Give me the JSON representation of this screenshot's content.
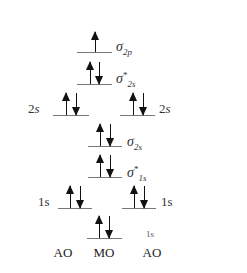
{
  "diagram": {
    "title": "",
    "levels": [
      {
        "id": "sigma_2p",
        "column": "MO",
        "y": 52,
        "x1": 77,
        "x2": 112,
        "electrons": "up",
        "label_symbol": "σ",
        "label_star": "",
        "label_sub": "2p"
      },
      {
        "id": "sigma_star_2s",
        "column": "MO",
        "y": 84,
        "x1": 77,
        "x2": 112,
        "electrons": "up-down",
        "label_symbol": "σ",
        "label_star": "*",
        "label_sub": "2s"
      },
      {
        "id": "ao_left_2s",
        "column": "AO",
        "y": 115,
        "x1": 53,
        "x2": 89,
        "electrons": "up-down",
        "label": "2s"
      },
      {
        "id": "ao_right_2s",
        "column": "AO",
        "y": 115,
        "x1": 120,
        "x2": 155,
        "electrons": "up-down",
        "label": "2s"
      },
      {
        "id": "sigma_2s",
        "column": "MO",
        "y": 146,
        "x1": 88,
        "x2": 122,
        "electrons": "up-down",
        "label_symbol": "σ",
        "label_star": "",
        "label_sub": "2s"
      },
      {
        "id": "sigma_star_1s",
        "column": "MO",
        "y": 177,
        "x1": 88,
        "x2": 122,
        "electrons": "up-down",
        "label_symbol": "σ",
        "label_star": "*",
        "label_sub": "1s"
      },
      {
        "id": "ao_left_1s",
        "column": "AO",
        "y": 208,
        "x1": 58,
        "x2": 92,
        "electrons": "up-down",
        "label": "1s"
      },
      {
        "id": "ao_right_1s",
        "column": "AO",
        "y": 208,
        "x1": 122,
        "x2": 156,
        "electrons": "up-down",
        "label": "1s"
      },
      {
        "id": "sigma_1s",
        "column": "MO",
        "y": 238,
        "x1": 87,
        "x2": 122,
        "electrons": "up-down",
        "label_fragment": "1s"
      }
    ],
    "labels": {
      "sigma_2p": {
        "symbol": "σ",
        "star": "",
        "sub": "2p"
      },
      "sigma_star_2s": {
        "symbol": "σ",
        "star": "*",
        "sub": "2s"
      },
      "sigma_2s": {
        "symbol": "σ",
        "star": "",
        "sub": "2s"
      },
      "sigma_star_1s": {
        "symbol": "σ",
        "star": "*",
        "sub": "1s"
      },
      "sigma_1s_fragment": "1s",
      "ao_left_2s": {
        "num": "2",
        "orb": "s"
      },
      "ao_right_2s": {
        "num": "2",
        "orb": "s"
      },
      "ao_left_1s": {
        "num": "1",
        "orb": "s"
      },
      "ao_right_1s": {
        "num": "1",
        "orb": "s"
      }
    },
    "columns": {
      "left": "AO",
      "middle": "MO",
      "right": "AO"
    },
    "colors": {
      "level_line": "#777777",
      "arrow": "#111111",
      "text": "#333333",
      "background": "#ffffff"
    }
  }
}
